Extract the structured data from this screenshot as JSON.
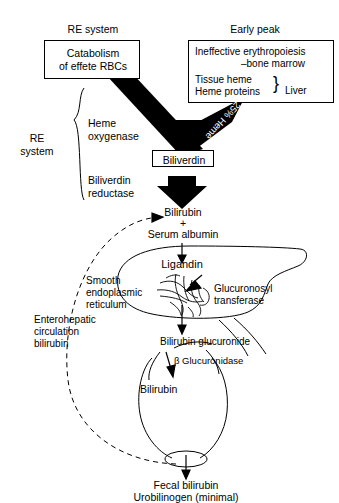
{
  "diagram": {
    "sources": {
      "re_system_label": "RE system",
      "early_peak_label": "Early peak",
      "left_box_line1": "Catabolism",
      "left_box_line2": "of effete RBCs",
      "right_box_line1": "Ineffective erythropoiesis",
      "right_box_line2": "–bone marrow",
      "right_box_line3": "Tissue heme",
      "right_box_line4": "Heme proteins",
      "right_box_brace": "}",
      "right_box_liver": "Liver"
    },
    "arrows": {
      "left_flux": "75% Heme",
      "right_flux": "25% Heme"
    },
    "re_bracket": {
      "label_line1": "RE",
      "label_line2": "system",
      "enzyme1_line1": "Heme",
      "enzyme1_line2": "oxygenase",
      "enzyme2_line1": "Biliverdin",
      "enzyme2_line2": "reductase"
    },
    "nodes": {
      "biliverdin": "Biliverdin",
      "bilirubin_free": "Bilirubin",
      "plus": "+",
      "serum_albumin": "Serum albumin",
      "ligandin": "Ligandin",
      "bilirubin_glucuronide": "Bilirubin glucuronide",
      "bilirubin_gut": "Bilirubin",
      "fecal_line1": "Fecal bilirubin",
      "fecal_line2": "Urobilinogen (minimal)"
    },
    "liver": {
      "ser_line1": "Smooth",
      "ser_line2": "endoplasmic",
      "ser_line3": "reticulum",
      "enzyme_line1": "Glucuronosyl",
      "enzyme_line2": "transferase"
    },
    "gut": {
      "beta_glucuronidase": "β Glucuronidase",
      "entero_line1": "Enterohepatic",
      "entero_line2": "circulation",
      "entero_line3": "bilirubin"
    },
    "colors": {
      "ink": "#000000",
      "paper": "#ffffff",
      "arrow_fill": "#000000",
      "arrow_text": "#ffffff"
    }
  }
}
